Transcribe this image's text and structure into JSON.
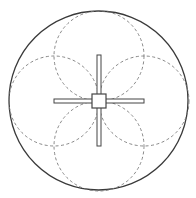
{
  "diagram": {
    "colors": {
      "background": "#ffffff",
      "outer_circle": "#3a3a3a",
      "dashed_circles": "#7a7a7a",
      "cross_stroke": "#444444",
      "cross_fill": "#ffffff"
    },
    "outer_circle": {
      "cx": 98.5,
      "cy": 100.5,
      "r": 89.5
    },
    "dashed_circles": [
      {
        "name": "top",
        "cx": 99,
        "cy": 56,
        "r": 45
      },
      {
        "name": "left",
        "cx": 54,
        "cy": 101,
        "r": 45
      },
      {
        "name": "right",
        "cx": 144,
        "cy": 101,
        "r": 45
      },
      {
        "name": "bottom",
        "cx": 99,
        "cy": 146,
        "r": 45
      }
    ],
    "cross": {
      "vertical_bar": {
        "x": 97,
        "y": 55,
        "width": 4,
        "height": 91
      },
      "horizontal_bar": {
        "x": 54,
        "y": 99,
        "width": 90,
        "height": 4
      },
      "center_square": {
        "x": 92,
        "y": 94,
        "width": 14,
        "height": 14
      }
    }
  }
}
